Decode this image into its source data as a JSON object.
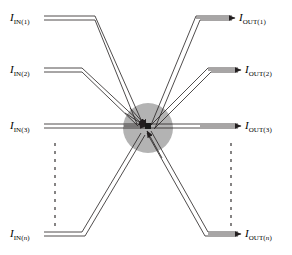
{
  "figure": {
    "width": 292,
    "height": 255,
    "background_color": "#ffffff",
    "line_color": "#231f20",
    "hub_fill_color": "#b3b3b3",
    "node_color": "#1a1a1a"
  },
  "hub": {
    "name": "central-coupler",
    "cx": 148,
    "cy": 128,
    "radius": 25,
    "node_size": 6
  },
  "inputs": [
    {
      "id": "in-1",
      "symbol": "I",
      "sub_prefix": "IN(",
      "sub_index": "1",
      "sub_index_italic": false,
      "sub_suffix": ")",
      "label_x": 10,
      "label_y": 12,
      "start_x": 44,
      "start_y": 18,
      "elbow_x": 95,
      "elbow_y": 18,
      "arrow_tip_x": 146,
      "arrow_tip_y": 126
    },
    {
      "id": "in-2",
      "symbol": "I",
      "sub_prefix": "IN(",
      "sub_index": "2",
      "sub_index_italic": false,
      "sub_suffix": ")",
      "label_x": 10,
      "label_y": 64,
      "start_x": 44,
      "start_y": 70,
      "elbow_x": 82,
      "elbow_y": 70,
      "arrow_tip_x": 146,
      "arrow_tip_y": 126
    },
    {
      "id": "in-3",
      "symbol": "I",
      "sub_prefix": "IN(",
      "sub_index": "3",
      "sub_index_italic": false,
      "sub_suffix": ")",
      "label_x": 10,
      "label_y": 120,
      "start_x": 44,
      "start_y": 126,
      "elbow_x": 44,
      "elbow_y": 126,
      "arrow_tip_x": 146,
      "arrow_tip_y": 126
    },
    {
      "id": "in-n",
      "symbol": "I",
      "sub_prefix": "IN(",
      "sub_index": "n",
      "sub_index_italic": true,
      "sub_suffix": ")",
      "label_x": 10,
      "label_y": 228,
      "start_x": 44,
      "start_y": 234,
      "elbow_x": 82,
      "elbow_y": 234,
      "arrow_tip_x": 146,
      "arrow_tip_y": 130
    }
  ],
  "outputs": [
    {
      "id": "out-1",
      "symbol": "I",
      "sub_prefix": "OUT(",
      "sub_index": "1",
      "sub_index_italic": false,
      "sub_suffix": ")",
      "label_x": 239,
      "label_y": 12,
      "start_x": 150,
      "start_y": 126,
      "elbow_x": 196,
      "elbow_y": 18,
      "arrow_tip_x": 236,
      "arrow_tip_y": 18
    },
    {
      "id": "out-2",
      "symbol": "I",
      "sub_prefix": "OUT(",
      "sub_index": "2",
      "sub_index_italic": false,
      "sub_suffix": ")",
      "label_x": 245,
      "label_y": 64,
      "start_x": 150,
      "start_y": 126,
      "elbow_x": 208,
      "elbow_y": 70,
      "arrow_tip_x": 242,
      "arrow_tip_y": 70
    },
    {
      "id": "out-3",
      "symbol": "I",
      "sub_prefix": "OUT(",
      "sub_index": "3",
      "sub_index_italic": false,
      "sub_suffix": ")",
      "label_x": 245,
      "label_y": 120,
      "start_x": 150,
      "start_y": 126,
      "elbow_x": 150,
      "elbow_y": 126,
      "arrow_tip_x": 242,
      "arrow_tip_y": 126
    },
    {
      "id": "out-n",
      "symbol": "I",
      "sub_prefix": "OUT(",
      "sub_index": "n",
      "sub_index_italic": true,
      "sub_suffix": ")",
      "label_x": 245,
      "label_y": 228,
      "start_x": 150,
      "start_y": 130,
      "elbow_x": 208,
      "elbow_y": 234,
      "arrow_tip_x": 242,
      "arrow_tip_y": 234
    }
  ],
  "ellipsis_markers": [
    {
      "id": "dashed-left",
      "x": 55,
      "y_start": 143,
      "y_end": 228,
      "dash": "3 5"
    },
    {
      "id": "dashed-right",
      "x": 231,
      "y_start": 143,
      "y_end": 228,
      "dash": "3 5"
    }
  ]
}
